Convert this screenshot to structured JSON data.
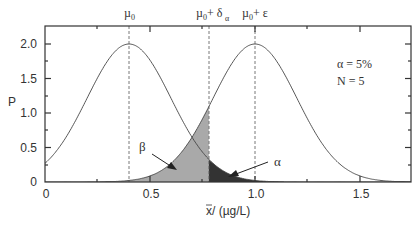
{
  "chart_data": {
    "type": "line",
    "title": "",
    "xlabel": "x̄ / (µg/L)",
    "ylabel": "P",
    "xlim": [
      0,
      1.74
    ],
    "ylim": [
      0,
      2.2
    ],
    "x_ticks": [
      0,
      0.5,
      1.0,
      1.5
    ],
    "x_tick_labels": [
      "0",
      "0.5",
      "1.0",
      "1.5"
    ],
    "y_ticks": [
      0,
      0.5,
      1.0,
      1.5,
      2.0
    ],
    "y_tick_labels": [
      "0",
      "0.5",
      "1.0",
      "1.5",
      "2.0"
    ],
    "grid": false,
    "series": [
      {
        "name": "H0 distribution (mean µ0)",
        "distribution": "normal",
        "mean": 0.4,
        "sd": 0.2,
        "peak": 2.0
      },
      {
        "name": "H1 distribution (mean µ0+ε)",
        "distribution": "normal",
        "mean": 1.0,
        "sd": 0.2,
        "peak": 2.0
      }
    ],
    "vertical_lines": [
      {
        "x": 0.4,
        "label": "µ0",
        "style": "dashed"
      },
      {
        "x": 0.78,
        "label": "µ0+ δα",
        "style": "dashed"
      },
      {
        "x": 1.0,
        "label": "µ0+ ε",
        "style": "dashed"
      }
    ],
    "shaded_regions": [
      {
        "label": "β",
        "description": "area under H1 curve left of µ0+δα",
        "color": "#a9a9a9"
      },
      {
        "label": "α",
        "description": "area under H0 curve right of µ0+δα",
        "color": "#333333"
      }
    ],
    "annotations": [
      "α = 5%",
      "N = 5"
    ]
  },
  "labels": {
    "mu0": "µ",
    "mu0_sub": "0",
    "delta_main": "µ",
    "delta_sub0": "0",
    "delta_plus": "+ δ",
    "delta_sub": "α",
    "eps_main": "µ",
    "eps_sub0": "0",
    "eps_plus": "+ ε",
    "alpha_note": "α = 5%",
    "n_note": "N = 5",
    "beta_label": "β",
    "alpha_label": "α",
    "ylabel": "P",
    "xlabel_bar": "x",
    "xlabel_rest": " / (µg/L)",
    "x0": "0",
    "x05": "0.5",
    "x10": "1.0",
    "x15": "1.5",
    "y0": "0",
    "y05": "0.5",
    "y10": "1.0",
    "y15": "1.5",
    "y20": "2.0"
  }
}
